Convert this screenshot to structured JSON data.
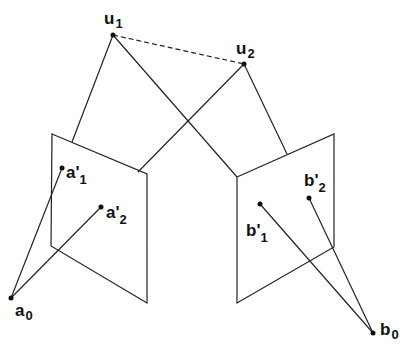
{
  "diagram": {
    "nodes": {
      "u1": {
        "label": "u",
        "sub": "1",
        "x": 113,
        "y": 35
      },
      "u2": {
        "label": "u",
        "sub": "2",
        "x": 244,
        "y": 64
      },
      "a1p": {
        "label": "a'",
        "sub": "1",
        "x": 62,
        "y": 168
      },
      "a2p": {
        "label": "a'",
        "sub": "2",
        "x": 101,
        "y": 207
      },
      "a0": {
        "label": "a",
        "sub": "0",
        "x": 11,
        "y": 298
      },
      "b1p": {
        "label": "b'",
        "sub": "1",
        "x": 260,
        "y": 204
      },
      "b2p": {
        "label": "b'",
        "sub": "2",
        "x": 309,
        "y": 198
      },
      "b0": {
        "label": "b",
        "sub": "0",
        "x": 373,
        "y": 333
      }
    },
    "planes": [
      {
        "name": "left-image-plane",
        "points": "52,134 147,174 147,303 51,246"
      },
      {
        "name": "right-image-plane",
        "points": "237,177 334,134 334,247 237,303"
      }
    ],
    "baseline": {
      "from": "u1",
      "to": "u2",
      "style": "dashed"
    }
  }
}
